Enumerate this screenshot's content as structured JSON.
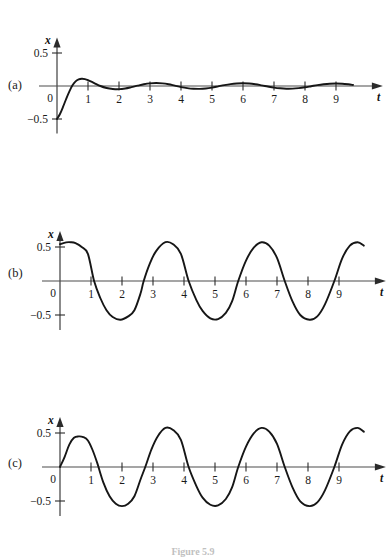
{
  "figure": {
    "caption": "Figure 5.9",
    "panels": [
      {
        "key": "a",
        "label": "(a)",
        "x_axis_label": "t",
        "y_axis_label": "x",
        "y_tick_labels": [
          "0.5",
          "0",
          "−0.5"
        ],
        "x_tick_labels": [
          "1",
          "2",
          "3",
          "4",
          "5",
          "6",
          "7",
          "8",
          "9"
        ]
      },
      {
        "key": "b",
        "label": "(b)",
        "x_axis_label": "t",
        "y_axis_label": "x",
        "y_tick_labels": [
          "0.5",
          "0",
          "−0.5"
        ],
        "x_tick_labels": [
          "1",
          "2",
          "3",
          "4",
          "5",
          "6",
          "7",
          "8",
          "9"
        ]
      },
      {
        "key": "c",
        "label": "(c)",
        "x_axis_label": "t",
        "y_axis_label": "x",
        "y_tick_labels": [
          "0.5",
          "0",
          "−0.5"
        ],
        "x_tick_labels": [
          "1",
          "2",
          "3",
          "4",
          "5",
          "6",
          "7",
          "8",
          "9"
        ]
      }
    ]
  },
  "chart_data": [
    {
      "type": "line",
      "panel": "a",
      "title": "(a)",
      "xlabel": "t",
      "ylabel": "x",
      "xlim": [
        0,
        9.9
      ],
      "ylim": [
        -0.62,
        0.62
      ],
      "xticks": [
        1,
        2,
        3,
        4,
        5,
        6,
        7,
        8,
        9
      ],
      "yticks": [
        -0.5,
        0,
        0.5
      ],
      "grid": false,
      "legend": "none",
      "description": "Transient (homogeneous) response: damped oscillation starting at x=-0.5, decaying slowly",
      "series": [
        {
          "name": "transient",
          "x": [
            0.0,
            0.1,
            0.2,
            0.3,
            0.4,
            0.5,
            0.6,
            0.7,
            0.8,
            0.9,
            1.0,
            1.2,
            1.4,
            1.6,
            1.8,
            2.0,
            2.2,
            2.4,
            2.6,
            2.8,
            3.0,
            3.2,
            3.4,
            3.6,
            3.8,
            4.0,
            4.2,
            4.4,
            4.6,
            4.8,
            5.0,
            5.2,
            5.4,
            5.6,
            5.8,
            6.0,
            6.2,
            6.4,
            6.6,
            6.8,
            7.0,
            7.2,
            7.4,
            7.6,
            7.8,
            8.0,
            8.2,
            8.4,
            8.6,
            8.8,
            9.0,
            9.2,
            9.4,
            9.55
          ],
          "y": [
            -0.5,
            -0.42,
            -0.31,
            -0.19,
            -0.08,
            0.01,
            0.07,
            0.1,
            0.11,
            0.105,
            0.09,
            0.045,
            0.0,
            -0.03,
            -0.045,
            -0.048,
            -0.038,
            -0.018,
            0.005,
            0.026,
            0.04,
            0.045,
            0.04,
            0.026,
            0.005,
            -0.016,
            -0.032,
            -0.042,
            -0.044,
            -0.038,
            -0.024,
            -0.005,
            0.014,
            0.029,
            0.038,
            0.041,
            0.037,
            0.026,
            0.01,
            -0.008,
            -0.024,
            -0.035,
            -0.041,
            -0.04,
            -0.032,
            -0.019,
            -0.003,
            0.013,
            0.026,
            0.035,
            0.038,
            0.035,
            0.026,
            0.016
          ]
        }
      ]
    },
    {
      "type": "line",
      "panel": "b",
      "title": "(b)",
      "xlabel": "t",
      "ylabel": "x",
      "xlim": [
        0,
        9.9
      ],
      "ylim": [
        -0.62,
        0.62
      ],
      "xticks": [
        1,
        2,
        3,
        4,
        5,
        6,
        7,
        8,
        9
      ],
      "yticks": [
        -0.5,
        0,
        0.5
      ],
      "grid": false,
      "legend": "none",
      "description": "Steady-state (particular) response: pure sinusoid, amplitude about 0.57, period about 3.1",
      "amplitude": 0.57,
      "period": 3.1,
      "series": [
        {
          "name": "steady-state",
          "x": [
            0.0,
            0.2,
            0.35,
            0.5,
            0.7,
            0.9,
            1.1,
            1.3,
            1.5,
            1.7,
            1.95,
            2.2,
            2.4,
            2.6,
            2.7,
            2.9,
            3.1,
            3.4,
            3.65,
            3.9,
            4.15,
            4.4,
            4.6,
            4.85,
            5.1,
            5.35,
            5.55,
            5.75,
            6.0,
            6.25,
            6.5,
            6.75,
            7.0,
            7.25,
            7.5,
            7.75,
            8.05,
            8.3,
            8.55,
            8.85,
            9.1,
            9.35,
            9.6,
            9.8
          ],
          "y": [
            0.54,
            0.568,
            0.57,
            0.556,
            0.5,
            0.4,
            0.0,
            -0.25,
            -0.43,
            -0.53,
            -0.57,
            -0.52,
            -0.43,
            -0.18,
            0.0,
            0.26,
            0.44,
            0.57,
            0.54,
            0.4,
            0.0,
            -0.28,
            -0.44,
            -0.55,
            -0.56,
            -0.47,
            -0.3,
            0.0,
            0.3,
            0.49,
            0.57,
            0.52,
            0.34,
            0.0,
            -0.3,
            -0.5,
            -0.57,
            -0.52,
            -0.34,
            0.0,
            0.33,
            0.52,
            0.57,
            0.52
          ]
        }
      ]
    },
    {
      "type": "line",
      "panel": "c",
      "title": "(c)",
      "xlabel": "t",
      "ylabel": "x",
      "xlim": [
        0,
        9.9
      ],
      "ylim": [
        -0.62,
        0.62
      ],
      "xticks": [
        1,
        2,
        3,
        4,
        5,
        6,
        7,
        8,
        9
      ],
      "yticks": [
        -0.5,
        0,
        0.5
      ],
      "grid": false,
      "legend": "none",
      "description": "Full solution (sum of transient and steady state): starts at x=0, first peak about 0.45, then approaches the steady-state sinusoid",
      "series": [
        {
          "name": "full-solution",
          "x": [
            0.0,
            0.15,
            0.3,
            0.45,
            0.6,
            0.75,
            0.9,
            1.05,
            1.2,
            1.4,
            1.6,
            1.8,
            2.0,
            2.2,
            2.4,
            2.6,
            2.75,
            2.95,
            3.15,
            3.4,
            3.65,
            3.9,
            4.15,
            4.4,
            4.6,
            4.85,
            5.1,
            5.35,
            5.55,
            5.75,
            6.0,
            6.25,
            6.5,
            6.75,
            7.0,
            7.25,
            7.5,
            7.75,
            8.05,
            8.3,
            8.55,
            8.85,
            9.1,
            9.35,
            9.6,
            9.8
          ],
          "y": [
            0.0,
            0.15,
            0.33,
            0.43,
            0.45,
            0.44,
            0.39,
            0.25,
            0.06,
            -0.23,
            -0.43,
            -0.54,
            -0.575,
            -0.54,
            -0.43,
            -0.18,
            0.0,
            0.26,
            0.45,
            0.575,
            0.545,
            0.4,
            0.0,
            -0.28,
            -0.45,
            -0.555,
            -0.565,
            -0.47,
            -0.3,
            0.0,
            0.3,
            0.495,
            0.575,
            0.52,
            0.34,
            0.0,
            -0.3,
            -0.505,
            -0.575,
            -0.52,
            -0.34,
            0.0,
            0.33,
            0.525,
            0.575,
            0.52
          ]
        }
      ]
    }
  ]
}
